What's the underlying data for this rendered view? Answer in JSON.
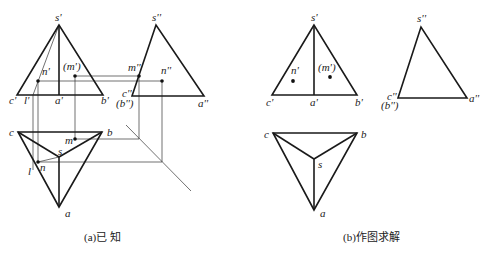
{
  "figure": {
    "panels": [
      {
        "id": "a",
        "caption": "(a)已 知",
        "front_view": {
          "labels": {
            "s": "s'",
            "c": "c'",
            "l": "l'",
            "a": "a'",
            "b": "b'",
            "n": "n'",
            "m": "(m')"
          }
        },
        "side_view": {
          "labels": {
            "s": "s''",
            "c": "c''",
            "b": "(b'')",
            "a": "a''",
            "m": "m''",
            "n": "n''"
          }
        },
        "top_view": {
          "labels": {
            "c": "c",
            "b": "b",
            "m": "m",
            "s": "s",
            "l": "l",
            "n": "n",
            "a": "a"
          }
        }
      },
      {
        "id": "b",
        "caption": "(b)作图求解",
        "front_view": {
          "labels": {
            "s": "s'",
            "c": "c'",
            "a": "a'",
            "b": "b'",
            "n": "n'",
            "m": "(m')"
          }
        },
        "side_view": {
          "labels": {
            "s": "s''",
            "c": "c''",
            "b": "(b'')",
            "a": "a''"
          }
        },
        "top_view": {
          "labels": {
            "c": "c",
            "b": "b",
            "s": "s",
            "a": "a"
          }
        }
      }
    ]
  }
}
